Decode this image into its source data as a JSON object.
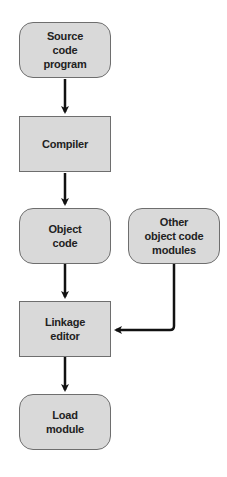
{
  "diagram": {
    "type": "flowchart",
    "nodes": {
      "source": {
        "label": "Source\ncode\nprogram",
        "shape": "rounded"
      },
      "compiler": {
        "label": "Compiler",
        "shape": "rectangle"
      },
      "object": {
        "label": "Object\ncode",
        "shape": "rounded"
      },
      "other": {
        "label": "Other\nobject code\nmodules",
        "shape": "rounded"
      },
      "linkage": {
        "label": "Linkage\neditor",
        "shape": "rectangle"
      },
      "load": {
        "label": "Load\nmodule",
        "shape": "rounded"
      }
    },
    "edges": [
      {
        "from": "source",
        "to": "compiler"
      },
      {
        "from": "compiler",
        "to": "object"
      },
      {
        "from": "object",
        "to": "linkage"
      },
      {
        "from": "other",
        "to": "linkage"
      },
      {
        "from": "linkage",
        "to": "load"
      }
    ],
    "colors": {
      "node_fill": "#d9d9d9",
      "node_border": "#6e6e6e",
      "arrow": "#111111"
    }
  }
}
